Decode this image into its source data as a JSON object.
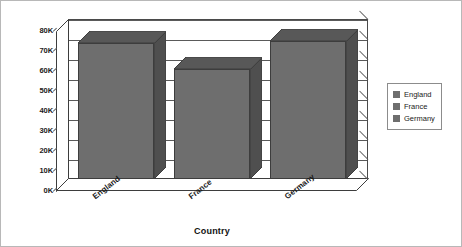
{
  "chart_data": {
    "type": "bar",
    "title": "",
    "subtitle": "",
    "xlabel": "Country",
    "ylabel": "Sum of Order Amount",
    "categories": [
      "England",
      "France",
      "Germany"
    ],
    "values": [
      68000,
      55000,
      69000
    ],
    "series": [
      {
        "name": "Sum of Order Amount",
        "values": [
          68000,
          55000,
          69000
        ]
      }
    ],
    "ylim": [
      0,
      80000
    ],
    "ytick_values": [
      0,
      10000,
      20000,
      30000,
      40000,
      50000,
      60000,
      70000,
      80000
    ],
    "ytick_labels": [
      "0K",
      "10K",
      "20K",
      "30K",
      "40K",
      "50K",
      "60K",
      "70K",
      "80K"
    ],
    "grid": true,
    "legend_position": "right",
    "legend_entries": [
      {
        "label": "England",
        "color": "#6e6e6e"
      },
      {
        "label": "France",
        "color": "#6e6e6e"
      },
      {
        "label": "Germany",
        "color": "#6e6e6e"
      }
    ],
    "style": "3d-column",
    "colors": {
      "bar_front": "#6e6e6e",
      "bar_side": "#4f4f4f",
      "bar_top": "#585858",
      "axis": "#3d3d3d",
      "grid": "#5a5a5a",
      "plot_background": "#ffffff",
      "text": "#1a1a1a",
      "legend_border": "#8c8c8c",
      "chart_border": "#b8b8b8"
    }
  }
}
